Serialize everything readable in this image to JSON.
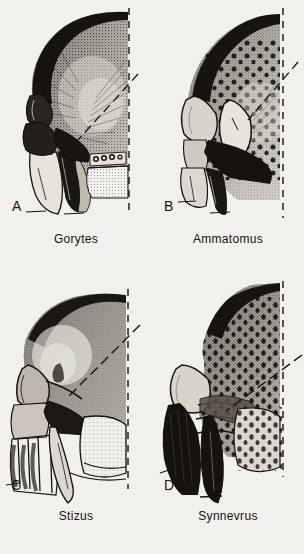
{
  "figure": {
    "kind": "scientific-illustration-plate",
    "layout": "2 columns x 2 rows",
    "background_color": "#f2f0ec",
    "ink_color": "#141210",
    "panel_count": 4
  },
  "panels": [
    {
      "letter": "A",
      "name": "Gorytes",
      "position": "top-left",
      "reference_line": "dashed vertical",
      "leader_line": "dashed diagonal from upper right toward mid face",
      "surface_texture": "dense fine stipple, darker dorsally"
    },
    {
      "letter": "B",
      "name": "Ammatomus",
      "position": "top-right",
      "reference_line": "dashed vertical",
      "leader_line": "dashed diagonal from upper right toward mid face",
      "surface_texture": "coarse round punctures over stipple"
    },
    {
      "letter": "C",
      "name": "Stizus",
      "position": "bottom-left",
      "reference_line": "dashed vertical",
      "leader_line": "dashed diagonal from upper right toward mid face",
      "surface_texture": "smooth fine stipple, pale highlight on vertex"
    },
    {
      "letter": "D",
      "name": "Synnevrus",
      "position": "bottom-right",
      "reference_line": "dashed vertical",
      "leader_line": "dashed diagonal from upper right toward mid face",
      "surface_texture": "coarse teardrop punctures, notched frontal margin"
    }
  ],
  "captions": {
    "a": "Gorytes",
    "b": "Ammatomus",
    "c": "Stizus",
    "d": "Synnevrus"
  },
  "letters": {
    "a": "A",
    "b": "B",
    "c": "C",
    "d": "D"
  }
}
